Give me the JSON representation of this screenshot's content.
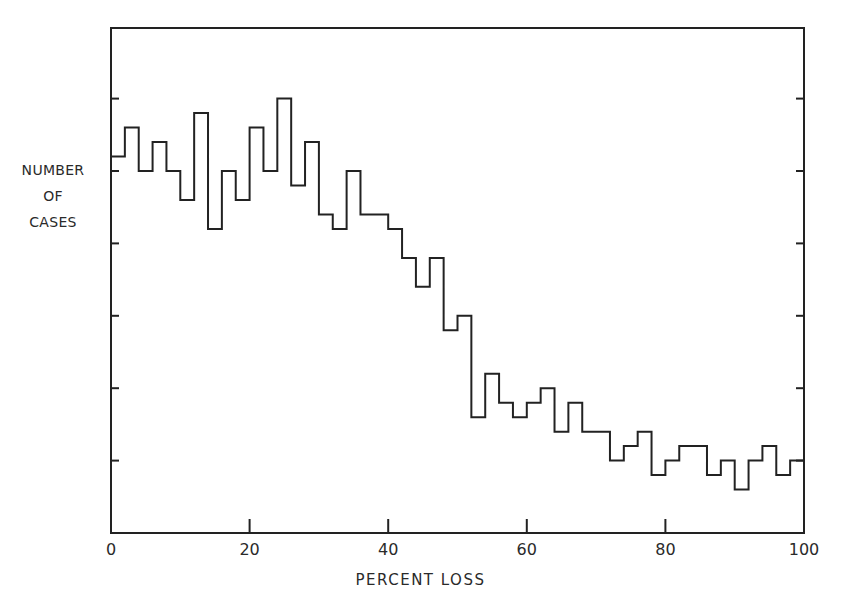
{
  "chart_data": {
    "type": "bar",
    "style": "step-histogram",
    "title": "",
    "xlabel": "PERCENT LOSS",
    "ylabel_lines": [
      "NUMBER",
      "OF",
      "CASES"
    ],
    "xlim": [
      0,
      100
    ],
    "x_ticks": [
      0,
      20,
      40,
      60,
      80,
      100
    ],
    "x_tick_labels": [
      "0",
      "20",
      "40",
      "60",
      "80",
      "100"
    ],
    "y_ticks_count": 6,
    "y_tick_labels": [],
    "y_units_note": "unlabeled y-axis; values in units of 1/5 tick interval",
    "ylim": [
      0,
      35
    ],
    "y_tick_step": 5,
    "bin_width": 2,
    "categories": [
      "0-2",
      "2-4",
      "4-6",
      "6-8",
      "8-10",
      "10-12",
      "12-14",
      "14-16",
      "16-18",
      "18-20",
      "20-22",
      "22-24",
      "24-26",
      "26-28",
      "28-30",
      "30-32",
      "32-34",
      "34-36",
      "36-38",
      "38-40",
      "40-42",
      "42-44",
      "44-46",
      "46-48",
      "48-50",
      "50-52",
      "52-54",
      "54-56",
      "56-58",
      "58-60",
      "60-62",
      "62-64",
      "64-66",
      "66-68",
      "68-70",
      "70-72",
      "72-74",
      "74-76",
      "76-78",
      "78-80",
      "80-82",
      "82-84",
      "84-86",
      "86-88",
      "88-90",
      "90-92",
      "92-94",
      "94-96",
      "96-98",
      "98-100"
    ],
    "values": [
      26,
      28,
      25,
      27,
      25,
      23,
      29,
      21,
      25,
      23,
      28,
      25,
      30,
      24,
      27,
      22,
      21,
      25,
      22,
      22,
      21,
      19,
      17,
      19,
      14,
      15,
      8,
      11,
      9,
      8,
      9,
      10,
      7,
      9,
      7,
      7,
      5,
      6,
      7,
      4,
      5,
      6,
      6,
      4,
      5,
      3,
      5,
      6,
      4,
      5
    ],
    "grid": false,
    "legend": null
  }
}
